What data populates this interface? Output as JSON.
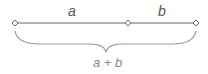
{
  "diagram": {
    "segments": [
      {
        "label": "a"
      },
      {
        "label": "b"
      }
    ],
    "sum_label": "a + b",
    "colors": {
      "line": "#666666",
      "brace": "#999999",
      "point_fill": "#ffffff",
      "point_stroke": "#666666"
    }
  }
}
